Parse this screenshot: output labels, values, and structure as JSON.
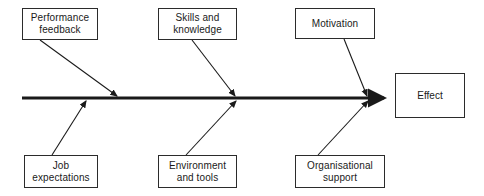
{
  "diagram": {
    "type": "fishbone-ishikawa",
    "title": "",
    "background_color": "#ffffff",
    "line_color": "#1a1a1a",
    "box_border_color": "#2b2b2b",
    "box_fill_color": "#ffffff",
    "spine": {
      "y": 98,
      "x_start": 22,
      "x_end": 396,
      "thickness": 3,
      "arrowhead": "right"
    },
    "causes_top": [
      {
        "id": "performance-feedback",
        "label": "Performance\nfeedback",
        "box": {
          "x": 22,
          "y": 8,
          "w": 76,
          "h": 32
        },
        "bone": {
          "x1": 40,
          "y1": 40,
          "x2": 118,
          "y2": 98
        }
      },
      {
        "id": "skills-and-knowledge",
        "label": "Skills and\nknowledge",
        "box": {
          "x": 158,
          "y": 8,
          "w": 79,
          "h": 32
        },
        "bone": {
          "x1": 192,
          "y1": 40,
          "x2": 236,
          "y2": 98
        }
      },
      {
        "id": "motivation",
        "label": "Motivation",
        "box": {
          "x": 295,
          "y": 8,
          "w": 80,
          "h": 31
        },
        "bone": {
          "x1": 344,
          "y1": 39,
          "x2": 368,
          "y2": 98
        }
      }
    ],
    "causes_bottom": [
      {
        "id": "job-expectations",
        "label": "Job\nexpectations",
        "box": {
          "x": 24,
          "y": 155,
          "w": 74,
          "h": 33
        },
        "bone": {
          "x1": 52,
          "y1": 155,
          "x2": 86,
          "y2": 100
        }
      },
      {
        "id": "environment-and-tools",
        "label": "Environment\nand tools",
        "box": {
          "x": 158,
          "y": 155,
          "w": 79,
          "h": 33
        },
        "bone": {
          "x1": 186,
          "y1": 155,
          "x2": 236,
          "y2": 100
        }
      },
      {
        "id": "organisational-support",
        "label": "Organisational\nsupport",
        "box": {
          "x": 295,
          "y": 155,
          "w": 90,
          "h": 33
        },
        "bone": {
          "x1": 318,
          "y1": 155,
          "x2": 368,
          "y2": 100
        }
      }
    ],
    "effect": {
      "id": "effect",
      "label": "Effect",
      "box": {
        "x": 395,
        "y": 73,
        "w": 70,
        "h": 45
      }
    }
  }
}
